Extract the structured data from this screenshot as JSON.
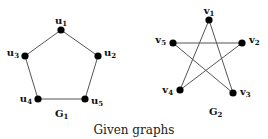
{
  "caption": "Given graphs",
  "graphs": [
    {
      "name": "G",
      "subscript": "1",
      "vertices": [
        {
          "id": "u1",
          "letter": "u",
          "sub": "1"
        },
        {
          "id": "u2",
          "letter": "u",
          "sub": "2"
        },
        {
          "id": "u3",
          "letter": "u",
          "sub": "3"
        },
        {
          "id": "u4",
          "letter": "u",
          "sub": "4"
        },
        {
          "id": "u5",
          "letter": "u",
          "sub": "5"
        }
      ],
      "edges": [
        [
          "u1",
          "u2"
        ],
        [
          "u2",
          "u5"
        ],
        [
          "u5",
          "u4"
        ],
        [
          "u4",
          "u3"
        ],
        [
          "u3",
          "u1"
        ]
      ]
    },
    {
      "name": "G",
      "subscript": "2",
      "vertices": [
        {
          "id": "v1",
          "letter": "v",
          "sub": "1"
        },
        {
          "id": "v2",
          "letter": "v",
          "sub": "2"
        },
        {
          "id": "v3",
          "letter": "v",
          "sub": "3"
        },
        {
          "id": "v4",
          "letter": "v",
          "sub": "4"
        },
        {
          "id": "v5",
          "letter": "v",
          "sub": "5"
        }
      ],
      "edges": [
        [
          "v1",
          "v4"
        ],
        [
          "v1",
          "v3"
        ],
        [
          "v5",
          "v2"
        ],
        [
          "v5",
          "v3"
        ],
        [
          "v2",
          "v4"
        ]
      ]
    }
  ]
}
